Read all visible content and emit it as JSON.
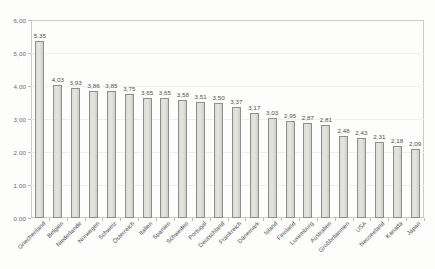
{
  "chart_data": {
    "type": "bar",
    "title": "",
    "xlabel": "",
    "ylabel": "",
    "ylim": [
      0,
      6
    ],
    "ytick_labels": [
      "0,00",
      "1,00",
      "2,00",
      "3,00",
      "4,00",
      "5,00",
      "6,00"
    ],
    "ytick_values": [
      0,
      1,
      2,
      3,
      4,
      5,
      6
    ],
    "grid": true,
    "legend": "none",
    "decimal_separator": ",",
    "categories": [
      "Griechenland",
      "Belgien",
      "Niederlande",
      "Norwegen",
      "Schweiz",
      "Österreich",
      "Italien",
      "Spanien",
      "Schweden",
      "Portugal",
      "Deutschland",
      "Frankreich",
      "Dänemark",
      "Island",
      "Finnland",
      "Luxemburg",
      "Australien",
      "Großbritannien",
      "USA",
      "Neuseeland",
      "Kanada",
      "Japan"
    ],
    "values": [
      5.35,
      4.03,
      3.93,
      3.86,
      3.85,
      3.75,
      3.65,
      3.65,
      3.58,
      3.51,
      3.5,
      3.37,
      3.17,
      3.03,
      2.95,
      2.87,
      2.81,
      2.48,
      2.43,
      2.31,
      2.18,
      2.09
    ],
    "value_labels": [
      "5,35",
      "4,03",
      "3,93",
      "3,86",
      "3,85",
      "3,75",
      "3,65",
      "3,65",
      "3,58",
      "3,51",
      "3,50",
      "3,37",
      "3,17",
      "3,03",
      "2,95",
      "2,87",
      "2,81",
      "2,48",
      "2,43",
      "2,31",
      "2,18",
      "2,09"
    ],
    "colors": {
      "bar_fill": "#dcdcd7",
      "bar_border": "#8d8f8b",
      "axis": "#c9cbc8",
      "grid": "#f0f0ee",
      "text": "#4e4f52",
      "background": "#fdfdfc"
    }
  }
}
